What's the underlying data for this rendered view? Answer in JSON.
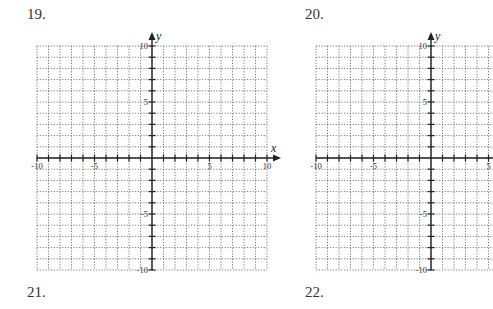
{
  "problems": [
    {
      "number": "19.",
      "x": 27,
      "y": 6
    },
    {
      "number": "20.",
      "x": 305,
      "y": 6
    },
    {
      "number": "21.",
      "x": 27,
      "y": 284
    },
    {
      "number": "22.",
      "x": 305,
      "y": 284
    }
  ],
  "graphs": [
    {
      "id": "graph-19",
      "left": 37,
      "top": 46,
      "width": 230,
      "height": 224,
      "xmin": -10,
      "xmax": 10,
      "ymin": -10,
      "ymax": 10,
      "x_label": "x",
      "y_label": "y",
      "x_tick_labels": [
        "-10",
        "-5",
        "5",
        "10"
      ],
      "y_tick_labels": [
        "10",
        "5",
        "-5",
        "-10"
      ]
    },
    {
      "id": "graph-20",
      "left": 316,
      "top": 46,
      "width": 230,
      "height": 224,
      "xmin": -10,
      "xmax": 10,
      "ymin": -10,
      "ymax": 10,
      "x_label": "x",
      "y_label": "y",
      "x_tick_labels": [
        "-10",
        "-5",
        "5",
        "10"
      ],
      "y_tick_labels": [
        "10",
        "5",
        "-5",
        "-10"
      ]
    }
  ],
  "colors": {
    "grid": "#555555",
    "axis": "#222222",
    "text": "#333333"
  }
}
